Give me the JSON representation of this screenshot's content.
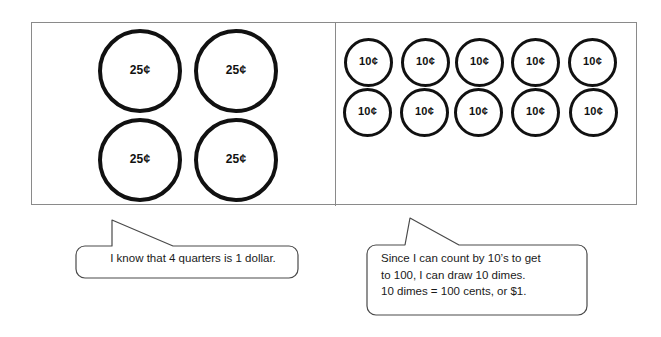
{
  "canvas": {
    "width": 661,
    "height": 337,
    "background": "#ffffff",
    "stroke_color": "#111111",
    "frame_color": "#8a8a8a"
  },
  "work_frame": {
    "left_panel": {
      "name": "quarters-panel",
      "coin_label": "25¢",
      "coin_count": 4,
      "coins": [
        {
          "label": "25¢",
          "left": 66,
          "top": 6
        },
        {
          "label": "25¢",
          "left": 162,
          "top": 6
        },
        {
          "label": "25¢",
          "left": 66,
          "top": 95
        },
        {
          "label": "25¢",
          "left": 162,
          "top": 95
        }
      ]
    },
    "right_panel": {
      "name": "dimes-panel",
      "coin_label": "10¢",
      "coin_count": 10,
      "coins": [
        {
          "label": "10¢",
          "left": 312,
          "top": 15
        },
        {
          "label": "10¢",
          "left": 369,
          "top": 15
        },
        {
          "label": "10¢",
          "left": 423,
          "top": 15
        },
        {
          "label": "10¢",
          "left": 479,
          "top": 15
        },
        {
          "label": "10¢",
          "left": 536,
          "top": 15
        },
        {
          "label": "10¢",
          "left": 311,
          "top": 65
        },
        {
          "label": "10¢",
          "left": 368,
          "top": 65
        },
        {
          "label": "10¢",
          "left": 422,
          "top": 65
        },
        {
          "label": "10¢",
          "left": 479,
          "top": 65
        },
        {
          "label": "10¢",
          "left": 537,
          "top": 65
        }
      ]
    }
  },
  "callouts": {
    "quarters": {
      "text": "I know that 4 quarters is 1 dollar."
    },
    "dimes": {
      "text": "Since I can count by 10’s to get\nto 100, I can draw 10 dimes.\n10 dimes = 100 cents, or $1."
    }
  }
}
